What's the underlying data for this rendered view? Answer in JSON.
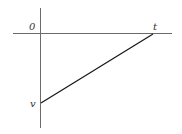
{
  "diagram": {
    "type": "velocity-time graph",
    "labels": {
      "origin": "0",
      "x_axis": "t",
      "y_point": "v"
    },
    "line": {
      "start": {
        "label": "v",
        "position": "negative y-axis intercept"
      },
      "end": {
        "label": "t",
        "position": "on time axis"
      }
    },
    "colors": {
      "axis": "#6b6b6b",
      "line": "#1a1a1a"
    }
  }
}
